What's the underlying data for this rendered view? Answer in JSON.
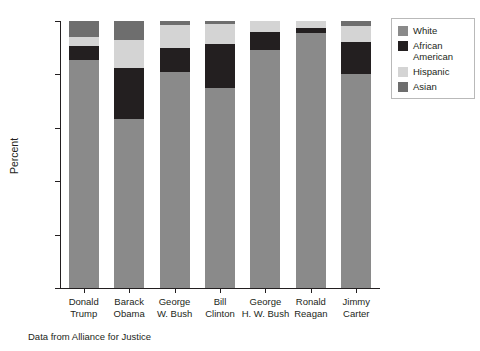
{
  "chart_data": {
    "type": "bar",
    "stacked": true,
    "title": "",
    "xlabel": "",
    "ylabel": "Percent",
    "ylim": [
      0,
      100
    ],
    "yticks": [
      0,
      20,
      40,
      60,
      80,
      100
    ],
    "grid": false,
    "legend_position": "right",
    "categories": [
      "Donald Trump",
      "Barack Obama",
      "George W. Bush",
      "Bill Clinton",
      "George H. W. Bush",
      "Ronald Reagan",
      "Jimmy Carter"
    ],
    "category_lines": [
      [
        "Donald",
        "Trump"
      ],
      [
        "Barack",
        "Obama"
      ],
      [
        "George",
        "W. Bush"
      ],
      [
        "Bill",
        "Clinton"
      ],
      [
        "George",
        "H. W. Bush"
      ],
      [
        "Ronald",
        "Reagan"
      ],
      [
        "Jimmy",
        "Carter"
      ]
    ],
    "series": [
      {
        "name": "White",
        "color": "#8a8a8a",
        "values": [
          85.5,
          63.3,
          81.0,
          75.0,
          89.0,
          95.5,
          80.0
        ]
      },
      {
        "name": "African American",
        "color": "#231f20",
        "values": [
          5.0,
          19.0,
          9.0,
          16.5,
          7.0,
          2.0,
          12.0
        ]
      },
      {
        "name": "Hispanic",
        "color": "#d4d4d4",
        "values": [
          3.5,
          10.5,
          8.5,
          7.5,
          4.0,
          2.5,
          6.0
        ]
      },
      {
        "name": "Asian",
        "color": "#6e6e6e",
        "values": [
          6.0,
          7.2,
          1.5,
          1.0,
          0.0,
          0.0,
          2.0
        ]
      }
    ],
    "annotations": [
      "Data from Alliance for Justice"
    ]
  },
  "axes": {
    "y_title": "Percent",
    "y_tick_labels": [
      "0",
      "20",
      "40",
      "60",
      "80",
      "100"
    ]
  },
  "legend": {
    "items": [
      {
        "label": "White",
        "color": "#8a8a8a"
      },
      {
        "label": "African American",
        "color": "#231f20"
      },
      {
        "label": "Hispanic",
        "color": "#d4d4d4"
      },
      {
        "label": "Asian",
        "color": "#6e6e6e"
      }
    ]
  },
  "caption": {
    "text": "Data from Alliance for Justice"
  }
}
